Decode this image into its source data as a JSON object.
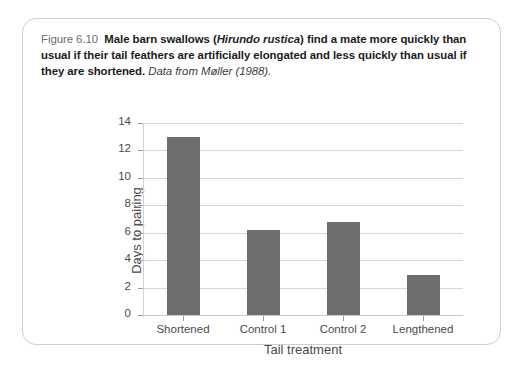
{
  "figure": {
    "number": "Figure 6.10",
    "caption_main_part1": "Male barn swallows (",
    "caption_species": "Hirundo rustica",
    "caption_main_part2": ") find a mate more quickly than usual if their tail feathers are artificially elongated and less quickly than usual if they are shortened.",
    "caption_source": "Data from Møller (1988)."
  },
  "colors": {
    "bar": "#6e6e6e",
    "gridline": "#d6d6d6",
    "axis": "#d2d2d2",
    "text": "#4a4a4a",
    "card_border": "#cfcfd2",
    "background": "#ffffff"
  },
  "chart_data": {
    "type": "bar",
    "title": "",
    "categories": [
      "Shortened",
      "Control 1",
      "Control 2",
      "Lengthened"
    ],
    "values": [
      13.0,
      6.2,
      6.75,
      2.9
    ],
    "xlabel": "Tail treatment",
    "ylabel": "Days to pairing",
    "ylim": [
      0,
      14
    ],
    "yticks": [
      0,
      2,
      4,
      6,
      8,
      10,
      12,
      14
    ],
    "ytick_labels": [
      "0",
      "2",
      "4",
      "6",
      "8",
      "10",
      "12",
      "14"
    ],
    "grid": true,
    "legend": false
  }
}
